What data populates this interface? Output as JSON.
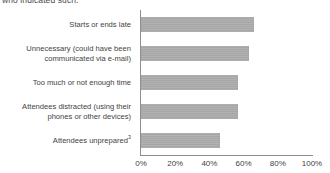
{
  "chart_data": {
    "type": "bar",
    "orientation": "horizontal",
    "title": "who indicated such:",
    "xlabel": "",
    "ylabel": "",
    "xlim": [
      0,
      100
    ],
    "xticks": [
      "0%",
      "20%",
      "40%",
      "60%",
      "80%",
      "100%"
    ],
    "xtick_values": [
      0,
      20,
      40,
      60,
      80,
      100
    ],
    "grid": false,
    "legend": null,
    "bar_color": "#a9a9a9",
    "axis_color": "#8e8e8e",
    "categories": [
      "Starts or ends late",
      "Unnecessary (could have been communicated via e-mail)",
      "Too much or not enough time",
      "Attendees distracted (using their phones or other devices)",
      "Attendees unprepared"
    ],
    "values": [
      66,
      63,
      57,
      57,
      46
    ],
    "rows": [
      {
        "lines": [
          "Starts or ends late"
        ],
        "superscript": "",
        "value": 66
      },
      {
        "lines": [
          "Unnecessary (could have been",
          "communicated via e-mail)"
        ],
        "superscript": "",
        "value": 63
      },
      {
        "lines": [
          "Too much or not enough time"
        ],
        "superscript": "",
        "value": 57
      },
      {
        "lines": [
          "Attendees distracted (using their",
          "phones or other devices)"
        ],
        "superscript": "",
        "value": 57
      },
      {
        "lines": [
          "Attendees unprepared"
        ],
        "superscript": "3",
        "value": 46
      }
    ]
  }
}
